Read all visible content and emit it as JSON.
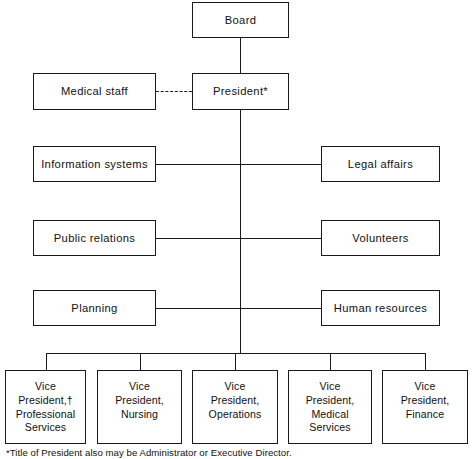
{
  "chart": {
    "type": "org-chart",
    "nodes": {
      "board": {
        "label": "Board"
      },
      "president": {
        "label": "President*"
      },
      "medical_staff": {
        "label": "Medical staff"
      },
      "information_systems": {
        "label": "Information systems"
      },
      "legal_affairs": {
        "label": "Legal affairs"
      },
      "public_relations": {
        "label": "Public relations"
      },
      "volunteers": {
        "label": "Volunteers"
      },
      "planning": {
        "label": "Planning"
      },
      "human_resources": {
        "label": "Human resources"
      },
      "vp_professional_services": {
        "label": "Vice\nPresident,†\nProfessional\nServices"
      },
      "vp_nursing": {
        "label": "Vice\nPresident,\nNursing"
      },
      "vp_operations": {
        "label": "Vice\nPresident,\nOperations"
      },
      "vp_medical_services": {
        "label": "Vice\nPresident,\nMedical\nServices"
      },
      "vp_finance": {
        "label": "Vice\nPresident,\nFinance"
      }
    },
    "footnotes": [
      {
        "marker": "*",
        "text": "*Title of President also may be Administrator or Executive Director."
      }
    ],
    "colors": {
      "line": "#1a1a1a",
      "box_fill": "#ffffff",
      "text": "#111111",
      "background": "#ffffff"
    }
  }
}
